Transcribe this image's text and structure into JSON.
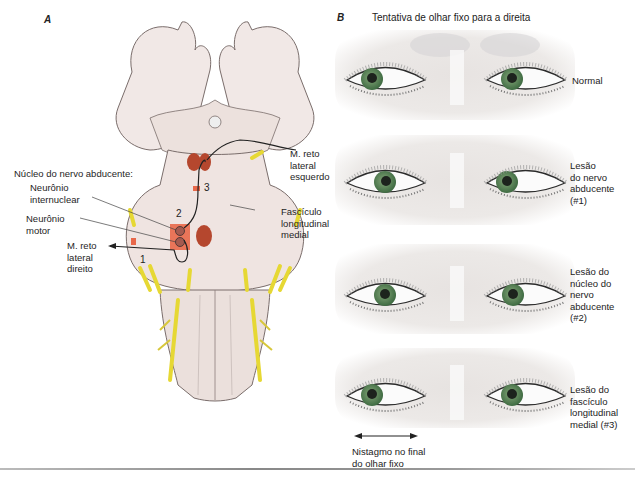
{
  "panel_a": {
    "letter": "A",
    "labels": {
      "nucleus_title": "Núcleo do nervo abducente:",
      "internuclear_neuron": [
        "Neurônio",
        "internuclear"
      ],
      "motor_neuron": [
        "Neurônio",
        "motor"
      ],
      "right_lateral_rectus": [
        "M. reto",
        "lateral",
        "direito"
      ],
      "left_lateral_rectus": [
        "M. reto",
        "lateral",
        "esquerdo"
      ],
      "mlf": [
        "Fascículo",
        "longitudinal",
        "medial"
      ]
    },
    "lesion_markers": [
      "1",
      "2",
      "3"
    ],
    "colors": {
      "tissue": "#efe6e3",
      "outline": "#7a6d6b",
      "nucleus": "#b5472e",
      "lesion": "#e8684a",
      "nerve": "#f1e64e"
    }
  },
  "panel_b": {
    "letter": "B",
    "title": "Tentativa de olhar fixo para a direita",
    "rows": [
      {
        "caption": [
          "Normal"
        ],
        "left_iris_offset": -10,
        "right_iris_offset": -10
      },
      {
        "caption": [
          "Lesão",
          "do nervo",
          "abducente",
          "(#1)"
        ],
        "left_iris_offset": -2,
        "right_iris_offset": -10
      },
      {
        "caption": [
          "Lesão do",
          "núcleo do",
          "nervo",
          "abducente",
          "(#2)"
        ],
        "left_iris_offset": 0,
        "right_iris_offset": 0
      },
      {
        "caption": [
          "Lesão do",
          "fascículo",
          "longitudinal",
          "medial (#3)"
        ],
        "left_iris_offset": -12,
        "right_iris_offset": 0
      }
    ],
    "nystagmus_note": [
      "Nistagmo no final",
      "do olhar fixo"
    ],
    "colors": {
      "iris": "#5f8c5a",
      "pupil": "#1d231d",
      "skin": "#ece8e6"
    }
  }
}
